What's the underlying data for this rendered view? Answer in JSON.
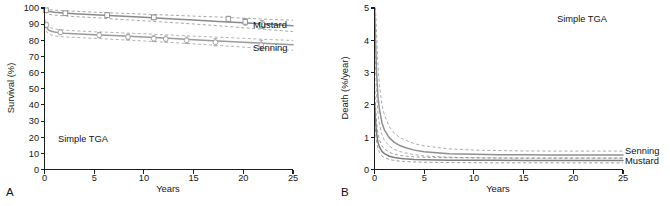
{
  "figure": {
    "panels": [
      {
        "letter": "A",
        "annotation": "Simple TGA",
        "xlabel": "Years",
        "ylabel": "Survival (%)"
      },
      {
        "letter": "B",
        "annotation": "Simple TGA",
        "xlabel": "Years",
        "ylabel": "Death (%/year)"
      }
    ],
    "series_labels": {
      "mustard": "Mustard",
      "senning": "Senning"
    }
  },
  "chart_data": [
    {
      "panel": "A",
      "type": "line",
      "title": "",
      "annotation": "Simple TGA",
      "xlabel": "Years",
      "ylabel": "Survival (%)",
      "xlim": [
        0,
        25
      ],
      "ylim": [
        0,
        100
      ],
      "xticks": [
        0,
        5,
        10,
        15,
        20,
        25
      ],
      "yticks": [
        0,
        10,
        20,
        30,
        40,
        50,
        60,
        70,
        80,
        90,
        100
      ],
      "grid": false,
      "legend_position": "right-inline",
      "series": [
        {
          "name": "Mustard",
          "color": "#8a8a8a",
          "marker": "square",
          "x": [
            0,
            0.25,
            0.5,
            1,
            2,
            3,
            5,
            7.5,
            10,
            12.5,
            15,
            17.5,
            20,
            22.5,
            25
          ],
          "values": [
            99.2,
            98.2,
            97.8,
            97.4,
            96.9,
            96.5,
            95.8,
            95.0,
            94.2,
            93.4,
            92.6,
            91.7,
            90.8,
            89.9,
            89.0
          ],
          "ci_upper": [
            100.0,
            99.3,
            99.0,
            98.7,
            98.3,
            98.0,
            97.4,
            96.8,
            96.2,
            95.6,
            95.0,
            94.4,
            93.7,
            93.0,
            92.4
          ],
          "ci_lower": [
            97.8,
            96.5,
            96.0,
            95.6,
            95.1,
            94.7,
            94.0,
            93.0,
            92.1,
            91.1,
            90.1,
            89.0,
            87.8,
            86.6,
            85.4
          ],
          "observed_points": [
            {
              "x": 0.15,
              "y": 98.6,
              "err": 1.0
            },
            {
              "x": 2.1,
              "y": 96.8,
              "err": 1.2
            },
            {
              "x": 6.3,
              "y": 95.6,
              "err": 1.3
            },
            {
              "x": 11.0,
              "y": 94.2,
              "err": 1.5
            },
            {
              "x": 18.5,
              "y": 93.2,
              "err": 1.7
            },
            {
              "x": 20.2,
              "y": 91.4,
              "err": 2.0
            },
            {
              "x": 21.9,
              "y": 89.8,
              "err": 2.4
            }
          ]
        },
        {
          "name": "Senning",
          "color": "#9a9a9a",
          "marker": "circle",
          "x": [
            0,
            0.2,
            0.4,
            0.7,
            1,
            1.5,
            2,
            3,
            5,
            7.5,
            10,
            12.5,
            15,
            17.5,
            20,
            22.5,
            25
          ],
          "values": [
            91.5,
            88.0,
            86.4,
            85.6,
            85.1,
            84.7,
            84.4,
            84.1,
            83.5,
            82.8,
            82.0,
            81.2,
            80.4,
            79.6,
            78.8,
            78.0,
            77.2
          ],
          "ci_upper": [
            93.5,
            90.2,
            88.5,
            87.6,
            87.1,
            86.6,
            86.3,
            85.9,
            85.3,
            84.7,
            84.0,
            83.3,
            82.6,
            81.9,
            81.2,
            80.5,
            79.9
          ],
          "ci_lower": [
            89.2,
            85.6,
            84.1,
            83.3,
            82.8,
            82.4,
            82.1,
            81.8,
            81.2,
            80.4,
            79.6,
            78.7,
            77.8,
            76.8,
            75.8,
            74.8,
            73.8
          ],
          "observed_points": [
            {
              "x": 0.2,
              "y": 89.5,
              "err": 1.6
            },
            {
              "x": 1.6,
              "y": 85.0,
              "err": 1.5
            },
            {
              "x": 5.5,
              "y": 83.2,
              "err": 1.6
            },
            {
              "x": 8.4,
              "y": 82.0,
              "err": 1.7
            },
            {
              "x": 11.0,
              "y": 81.0,
              "err": 1.8
            },
            {
              "x": 12.2,
              "y": 80.8,
              "err": 1.8
            },
            {
              "x": 14.3,
              "y": 80.0,
              "err": 2.0
            },
            {
              "x": 17.2,
              "y": 78.8,
              "err": 2.2
            },
            {
              "x": 21.8,
              "y": 77.0,
              "err": 3.0
            }
          ]
        }
      ]
    },
    {
      "panel": "B",
      "type": "line",
      "title": "",
      "annotation": "Simple TGA",
      "xlabel": "Years",
      "ylabel": "Death (%/year)",
      "xlim": [
        0,
        25
      ],
      "ylim": [
        0,
        5
      ],
      "xticks": [
        0,
        5,
        10,
        15,
        20,
        25
      ],
      "yticks": [
        0,
        1,
        2,
        3,
        4,
        5
      ],
      "grid": false,
      "legend_position": "right-inline",
      "series": [
        {
          "name": "Senning",
          "color": "#8f8f8f",
          "x": [
            0.02,
            0.1,
            0.2,
            0.35,
            0.5,
            0.75,
            1,
            1.5,
            2,
            2.5,
            3,
            4,
            5,
            7.5,
            10,
            12.5,
            15,
            17.5,
            20,
            22.5,
            25
          ],
          "values": [
            5.0,
            4.05,
            3.05,
            2.25,
            1.85,
            1.45,
            1.22,
            0.98,
            0.84,
            0.75,
            0.69,
            0.6,
            0.55,
            0.49,
            0.47,
            0.46,
            0.455,
            0.45,
            0.45,
            0.45,
            0.45
          ],
          "ci_upper": [
            5.0,
            5.0,
            4.3,
            3.2,
            2.6,
            2.0,
            1.68,
            1.32,
            1.12,
            1.0,
            0.92,
            0.8,
            0.73,
            0.64,
            0.6,
            0.585,
            0.575,
            0.57,
            0.57,
            0.57,
            0.57
          ],
          "ci_lower": [
            4.2,
            3.2,
            2.35,
            1.7,
            1.38,
            1.08,
            0.9,
            0.72,
            0.62,
            0.56,
            0.52,
            0.46,
            0.42,
            0.38,
            0.365,
            0.355,
            0.35,
            0.35,
            0.35,
            0.35,
            0.35
          ]
        },
        {
          "name": "Mustard",
          "color": "#7d7d7d",
          "x": [
            0.02,
            0.1,
            0.2,
            0.35,
            0.5,
            0.75,
            1,
            1.5,
            2,
            2.5,
            3,
            4,
            5,
            7.5,
            10,
            12.5,
            15,
            17.5,
            20,
            22.5,
            25
          ],
          "values": [
            2.05,
            1.55,
            1.15,
            0.84,
            0.7,
            0.56,
            0.49,
            0.41,
            0.37,
            0.345,
            0.33,
            0.31,
            0.3,
            0.29,
            0.285,
            0.283,
            0.282,
            0.281,
            0.28,
            0.28,
            0.28
          ],
          "ci_upper": [
            2.6,
            2.0,
            1.5,
            1.1,
            0.92,
            0.73,
            0.64,
            0.53,
            0.47,
            0.44,
            0.42,
            0.39,
            0.38,
            0.365,
            0.36,
            0.357,
            0.355,
            0.355,
            0.355,
            0.355,
            0.355
          ],
          "ci_lower": [
            1.6,
            1.2,
            0.88,
            0.64,
            0.53,
            0.42,
            0.37,
            0.31,
            0.28,
            0.26,
            0.25,
            0.235,
            0.225,
            0.215,
            0.21,
            0.208,
            0.207,
            0.206,
            0.205,
            0.205,
            0.205
          ]
        }
      ]
    }
  ]
}
